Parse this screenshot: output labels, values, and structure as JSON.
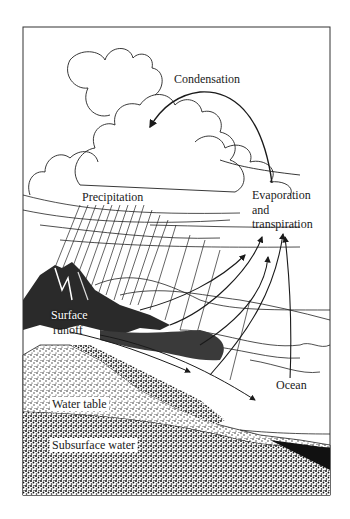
{
  "diagram": {
    "labels": {
      "condensation": "Condensation",
      "precipitation": "Precipitation",
      "evaporation_line1": "Evaporation",
      "evaporation_line2": "and",
      "evaporation_line3": "transpiration",
      "surface_runoff_line1": "Surface",
      "surface_runoff_line2": "runoff",
      "ocean": "Ocean",
      "water_table": "Water table",
      "subsurface_water": "Subsurface water"
    },
    "colors": {
      "ink": "#1a1a1a",
      "background": "#ffffff",
      "mountain": "#2a2a2a",
      "ground_speckle": "#3a3a3a"
    }
  }
}
